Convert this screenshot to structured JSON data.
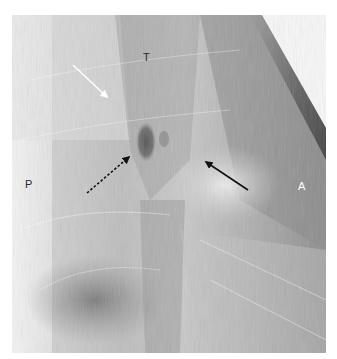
{
  "figure": {
    "type": "lateral chest radiograph",
    "labels": [
      {
        "id": "T",
        "text": "T",
        "x": 143,
        "y": 52,
        "color": "#2a2a2a"
      },
      {
        "id": "P",
        "text": "P",
        "x": 25,
        "y": 179,
        "color": "#2a2a2a"
      },
      {
        "id": "A",
        "text": "A",
        "x": 298,
        "y": 181,
        "color": "#ffffff"
      }
    ],
    "arrows": [
      {
        "id": "white-arrow",
        "style": "solid",
        "color": "#ffffff",
        "from": [
          73,
          65
        ],
        "to": [
          107,
          97
        ]
      },
      {
        "id": "dotted-arrow",
        "style": "dotted",
        "color": "#111111",
        "from": [
          87,
          193
        ],
        "to": [
          129,
          157
        ]
      },
      {
        "id": "black-arrow",
        "style": "solid",
        "color": "#111111",
        "from": [
          248,
          190
        ],
        "to": [
          206,
          162
        ]
      }
    ]
  }
}
